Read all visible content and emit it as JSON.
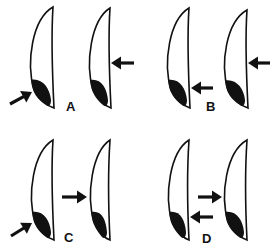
{
  "figure": {
    "panels": [
      {
        "label": "A",
        "label_pos": [
          66,
          111
        ],
        "lenses": [
          {
            "top": [
              53,
              7
            ],
            "bottom": [
              54,
              108
            ],
            "left_x": 28
          },
          {
            "top": [
              110,
              8
            ],
            "bottom": [
              111,
              108
            ],
            "left_x": 87
          }
        ],
        "arrows": [
          {
            "from": [
              10,
              104
            ],
            "to": [
              32,
              92
            ],
            "direction": "up-right"
          },
          {
            "from": [
              134,
              63
            ],
            "to": [
              111,
              63
            ],
            "direction": "left"
          }
        ]
      },
      {
        "label": "B",
        "label_pos": [
          206,
          111
        ],
        "lenses": [
          {
            "top": [
              189,
              8
            ],
            "bottom": [
              190,
              108
            ],
            "left_x": 165
          },
          {
            "top": [
              247,
              10
            ],
            "bottom": [
              248,
              108
            ],
            "left_x": 222
          }
        ],
        "arrows": [
          {
            "from": [
              213,
              88
            ],
            "to": [
              191,
              88
            ],
            "direction": "left"
          },
          {
            "from": [
              270,
              63
            ],
            "to": [
              248,
              63
            ],
            "direction": "left"
          }
        ]
      },
      {
        "label": "C",
        "label_pos": [
          64,
          242
        ],
        "lenses": [
          {
            "top": [
              53,
              140
            ],
            "bottom": [
              54,
              240
            ],
            "left_x": 29
          },
          {
            "top": [
              110,
              140
            ],
            "bottom": [
              110,
              240
            ],
            "left_x": 88
          }
        ],
        "arrows": [
          {
            "from": [
              11,
              236
            ],
            "to": [
              32,
              223
            ],
            "direction": "up-right"
          },
          {
            "from": [
              62,
              197
            ],
            "to": [
              87,
              197
            ],
            "direction": "right"
          }
        ]
      },
      {
        "label": "D",
        "label_pos": [
          202,
          243
        ],
        "lenses": [
          {
            "top": [
              189,
              140
            ],
            "bottom": [
              189,
              240
            ],
            "left_x": 166
          },
          {
            "top": [
              247,
              140
            ],
            "bottom": [
              247,
              240
            ],
            "left_x": 222
          }
        ],
        "arrows": [
          {
            "from": [
              198,
              197
            ],
            "to": [
              222,
              197
            ],
            "direction": "right"
          },
          {
            "from": [
              213,
              217
            ],
            "to": [
              190,
              217
            ],
            "direction": "left"
          }
        ]
      }
    ]
  }
}
